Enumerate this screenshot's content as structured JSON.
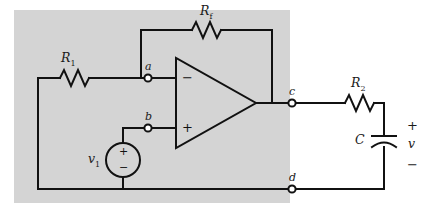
{
  "figure": {
    "type": "circuit-schematic",
    "title": "",
    "background_panel_color": "#d4d4d4",
    "wire_color": "#111111",
    "page_color": "#ffffff"
  },
  "components": {
    "r1": {
      "label": "R",
      "subscript": "1",
      "name": "resistor-r1"
    },
    "rf": {
      "label": "R",
      "subscript": "f",
      "name": "resistor-rf"
    },
    "r2": {
      "label": "R",
      "subscript": "2",
      "name": "resistor-r2"
    },
    "cap": {
      "label": "C",
      "name": "capacitor-c"
    },
    "source": {
      "label": "v",
      "subscript": "1",
      "plus": "+",
      "minus": "−",
      "name": "voltage-source-v1"
    },
    "opamp": {
      "inverting": "−",
      "noninverting": "+",
      "name": "op-amp"
    }
  },
  "nodes": {
    "a": "a",
    "b": "b",
    "c": "c",
    "d": "d"
  },
  "output": {
    "plus": "+",
    "minus": "−",
    "label": "v"
  }
}
